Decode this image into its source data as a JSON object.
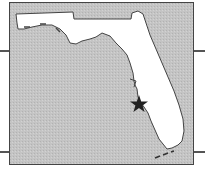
{
  "map": {
    "region": "Florida",
    "colors": {
      "water": "#c4c4c4",
      "land": "#ffffff",
      "coastline": "#444444",
      "frame": "#444444",
      "marker": "#222222"
    },
    "marker": {
      "icon": "star-icon",
      "x": 129,
      "y": 101,
      "label": ""
    }
  }
}
